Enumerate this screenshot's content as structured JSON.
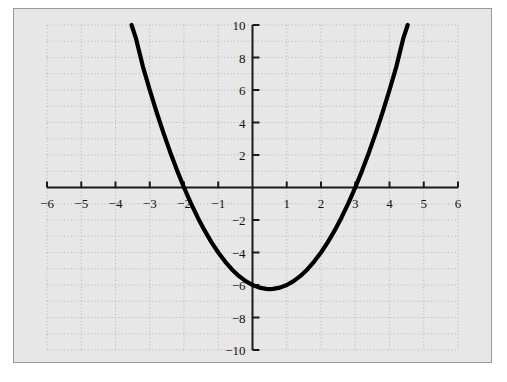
{
  "chart_data": {
    "type": "line",
    "title": "",
    "subtitle": "",
    "xlabel": "",
    "ylabel": "",
    "xlim": [
      -6,
      6
    ],
    "ylim": [
      -10,
      10
    ],
    "grid": true,
    "grid_style": "dotted",
    "grid_spacing": 1,
    "legend": "none",
    "background_color": "#e7e7e7",
    "curve_color": "#000000",
    "axis_color": "#1a1a1a",
    "grid_color": "#b4b4b4",
    "border_color": "#9a9a9a",
    "x_ticks": [
      -6,
      -5,
      -4,
      -3,
      -2,
      -1,
      1,
      2,
      3,
      4,
      5,
      6
    ],
    "x_tick_labels": [
      "−6",
      "−5",
      "−4",
      "−3",
      "−2",
      "−1",
      "1",
      "2",
      "3",
      "4",
      "5",
      "6"
    ],
    "y_ticks": [
      10,
      8,
      6,
      4,
      2,
      -2,
      -4,
      -6,
      -8,
      -10
    ],
    "y_tick_labels": [
      "10",
      "8",
      "6",
      "4",
      "2",
      "−2",
      "−4",
      "−6",
      "−8",
      "−10"
    ],
    "origin_label": "",
    "annotations": [],
    "series": [
      {
        "name": "parabola",
        "equation": "y = x^2 - x - 6",
        "roots": [
          -2,
          3
        ],
        "vertex": [
          0.5,
          -6.25
        ],
        "x_domain": [
          -3.5311,
          4.5311
        ],
        "x": [
          -3.5311,
          -3.4,
          -3.2,
          -3.0,
          -2.8,
          -2.6,
          -2.4,
          -2.2,
          -2.0,
          -1.8,
          -1.6,
          -1.4,
          -1.2,
          -1.0,
          -0.8,
          -0.6,
          -0.4,
          -0.2,
          0.0,
          0.2,
          0.4,
          0.5,
          0.6,
          0.8,
          1.0,
          1.2,
          1.4,
          1.6,
          1.8,
          2.0,
          2.2,
          2.4,
          2.6,
          2.8,
          3.0,
          3.2,
          3.4,
          3.6,
          3.8,
          4.0,
          4.2,
          4.4,
          4.5311
        ],
        "y": [
          10.0,
          9.16,
          7.44,
          6.0,
          4.64,
          3.36,
          2.16,
          1.04,
          0.0,
          -0.96,
          -1.84,
          -2.64,
          -3.36,
          -4.0,
          -4.56,
          -5.04,
          -5.44,
          -5.76,
          -6.0,
          -6.16,
          -6.24,
          -6.25,
          -6.24,
          -6.16,
          -6.0,
          -5.76,
          -5.44,
          -5.04,
          -4.56,
          -4.0,
          -3.36,
          -2.64,
          -1.84,
          -0.96,
          0.0,
          1.04,
          2.16,
          3.36,
          4.64,
          6.0,
          7.44,
          9.16,
          10.0
        ]
      }
    ]
  },
  "figure": {
    "caption": "",
    "x_axis_name": "x-axis",
    "y_axis_name": "y-axis"
  }
}
